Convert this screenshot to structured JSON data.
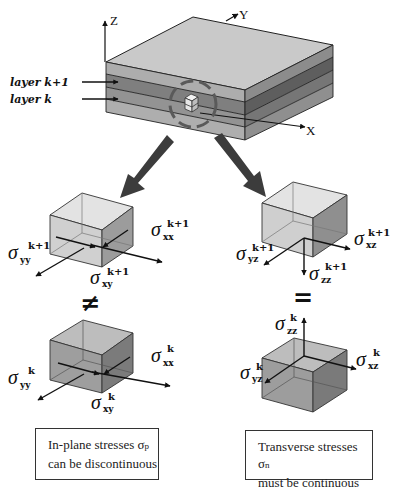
{
  "axes": {
    "x": "X",
    "y": "Y",
    "z": "Z"
  },
  "layers": {
    "upper": "layer k+1",
    "lower": "layer k"
  },
  "relations": {
    "in_plane": "≠",
    "transverse": "="
  },
  "cubes": {
    "upper_left": {
      "sxx": {
        "sym": "σ",
        "sub": "xx",
        "sup": "k+1"
      },
      "syy": {
        "sym": "σ",
        "sub": "yy",
        "sup": "k+1"
      },
      "sxy": {
        "sym": "σ",
        "sub": "xy",
        "sup": "k+1"
      }
    },
    "lower_left": {
      "sxx": {
        "sym": "σ",
        "sub": "xx",
        "sup": "k"
      },
      "syy": {
        "sym": "σ",
        "sub": "yy",
        "sup": "k"
      },
      "sxy": {
        "sym": "σ",
        "sub": "xy",
        "sup": "k"
      }
    },
    "upper_right": {
      "sxz": {
        "sym": "σ",
        "sub": "xz",
        "sup": "k+1"
      },
      "syz": {
        "sym": "σ",
        "sub": "yz",
        "sup": "k+1"
      },
      "szz": {
        "sym": "σ",
        "sub": "zz",
        "sup": "k+1"
      }
    },
    "lower_right": {
      "sxz": {
        "sym": "σ",
        "sub": "xz",
        "sup": "k"
      },
      "syz": {
        "sym": "σ",
        "sub": "yz",
        "sup": "k"
      },
      "szz": {
        "sym": "σ",
        "sub": "zz",
        "sup": "k"
      }
    }
  },
  "captions": {
    "left": {
      "line1": "In-plane stresses ",
      "sym": "σ",
      "sub": "p",
      "line2": "can be discontinuous"
    },
    "right": {
      "line1": "Transverse stresses ",
      "sym": "σ",
      "sub": "n",
      "line2": "must be continuous"
    }
  },
  "colors": {
    "plate_top": "#c9c9c9",
    "band_light": "#aeaeae",
    "band_dark": "#7d7d7d",
    "band_mid": "#959595",
    "side_shade": "#6f6f6f",
    "arrow": "#3a3a3a",
    "cube_light_top": "#e2e2e2",
    "cube_light_front": "#cfcfcf",
    "cube_light_side": "#9a9a9a",
    "cube_dark_top": "#bdbdbd",
    "cube_dark_front": "#9d9d9d",
    "cube_dark_side": "#7a7a7a"
  }
}
